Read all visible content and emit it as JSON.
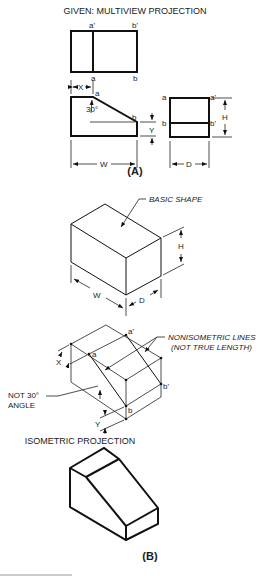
{
  "part_a": {
    "title": "GIVEN: MULTIVIEW PROJECTION",
    "caption": "(A)",
    "top_view": {
      "labels": {
        "a_prime": "a'",
        "b_prime": "b'",
        "a": "a",
        "b": "b"
      }
    },
    "front_view": {
      "labels": {
        "a": "a",
        "b": "b",
        "angle": "30°",
        "x_dim": "X",
        "y_dim": "Y",
        "w_dim": "W"
      }
    },
    "side_view": {
      "labels": {
        "a": "a",
        "a_prime": "a'",
        "b": "b",
        "b_prime": "b'",
        "h_dim": "H",
        "d_dim": "D"
      }
    }
  },
  "part_b": {
    "caption": "(B)",
    "basic_shape": {
      "callout": "BASIC SHAPE",
      "labels": {
        "h_dim": "H",
        "w_dim": "W",
        "d_dim": "D"
      }
    },
    "construction": {
      "callout_line1": "NONISOMETRIC LINES",
      "callout_line2": "(NOT TRUE LENGTH)",
      "angle_note_line1": "NOT 30°",
      "angle_note_line2": "ANGLE",
      "labels": {
        "a": "a",
        "a_prime": "a'",
        "b": "b",
        "b_prime": "b'",
        "x_dim": "X",
        "y_dim": "Y"
      }
    },
    "result_title": "ISOMETRIC PROJECTION"
  }
}
